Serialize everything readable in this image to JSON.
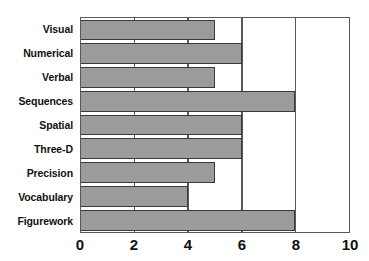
{
  "chart_data": {
    "type": "bar",
    "orientation": "horizontal",
    "title": "",
    "xlabel": "",
    "ylabel": "",
    "categories": [
      "Visual",
      "Numerical",
      "Verbal",
      "Sequences",
      "Spatial",
      "Three-D",
      "Precision",
      "Vocabulary",
      "Figurework"
    ],
    "values": [
      5,
      6,
      5,
      8,
      6,
      6,
      5,
      4,
      8
    ],
    "xlim": [
      0,
      10
    ],
    "xticks": [
      "0",
      "2",
      "4",
      "6",
      "8",
      "10"
    ],
    "xtick_values": [
      0,
      2,
      4,
      6,
      8,
      10
    ],
    "gridlines": [
      2,
      4,
      6,
      8
    ],
    "grid": true,
    "legend": "none",
    "bar_fill_color": "#9b9b9b",
    "bar_border_color": "#3a3a3a",
    "frame_color": "#59595b"
  }
}
